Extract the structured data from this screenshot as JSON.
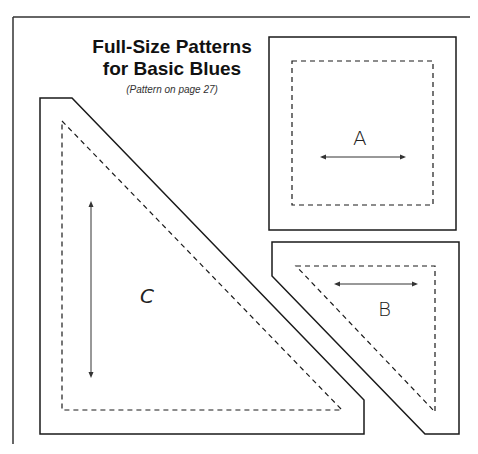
{
  "header": {
    "title_line1": "Full-Size Patterns",
    "title_line2": "for Basic Blues",
    "subtitle": "(Pattern on page 27)"
  },
  "pieces": [
    {
      "id": "A",
      "label": "A",
      "shape": "square",
      "grain_arrow": "horizontal"
    },
    {
      "id": "B",
      "label": "B",
      "shape": "triangle",
      "grain_arrow": "horizontal"
    },
    {
      "id": "C",
      "label": "C",
      "shape": "triangle",
      "grain_arrow": "vertical"
    }
  ],
  "colors": {
    "line": "#1a1a1a",
    "background": "#ffffff"
  }
}
